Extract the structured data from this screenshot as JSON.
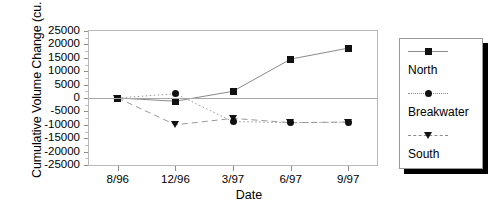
{
  "chart_data": {
    "type": "line",
    "title": "",
    "xlabel": "Date",
    "ylabel": "Cumulative Volume Change (cu. m.)",
    "categories": [
      "8/96",
      "12/96",
      "3/97",
      "6/97",
      "9/97"
    ],
    "ylim": [
      -25000,
      25000
    ],
    "ytick_step": 5000,
    "yticks": [
      25000,
      20000,
      15000,
      10000,
      5000,
      0,
      -5000,
      -10000,
      -15000,
      -20000,
      -25000
    ],
    "ytick_labels": [
      "25000",
      "20000",
      "15000",
      "10000",
      "5000",
      "0",
      "-5000",
      "-10000",
      "-15000",
      "-20000",
      "-25000"
    ],
    "grid": false,
    "zero_line": true,
    "legend_position": "right-outside",
    "series": [
      {
        "name": "North",
        "marker": "square",
        "linestyle": "solid",
        "color": "#8a8a8a",
        "values": [
          0,
          -1200,
          2500,
          14500,
          18600
        ]
      },
      {
        "name": "Breakwater",
        "marker": "circle",
        "linestyle": "dotted",
        "color": "#9a9a9a",
        "values": [
          0,
          1600,
          -8800,
          -9200,
          -9000
        ]
      },
      {
        "name": "South",
        "marker": "triangle-down",
        "linestyle": "dashed",
        "color": "#9a9a9a",
        "values": [
          0,
          -10000,
          -7600,
          -9200,
          -9000
        ]
      }
    ]
  },
  "legend": {
    "entries": [
      {
        "label": "North"
      },
      {
        "label": "Breakwater"
      },
      {
        "label": "South"
      }
    ]
  }
}
